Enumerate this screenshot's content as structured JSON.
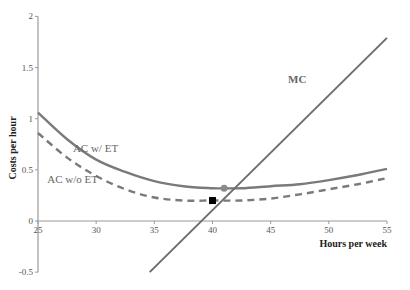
{
  "chart_data": {
    "type": "line",
    "title": "",
    "xlabel": "Hours per week",
    "ylabel": "Costs per hour",
    "xlim": [
      25,
      55
    ],
    "ylim": [
      -0.5,
      2
    ],
    "xticks": [
      25,
      30,
      35,
      40,
      45,
      50,
      55
    ],
    "xtick_labels": [
      "25",
      "30",
      "35",
      "40",
      "45",
      "50",
      "55"
    ],
    "yticks": [
      -0.5,
      0,
      0.5,
      1,
      1.5,
      2
    ],
    "ytick_labels": [
      "-0.5",
      "0",
      "0.5",
      "1",
      "1.5",
      "2"
    ],
    "grid": false,
    "legend": "inline labels",
    "series": [
      {
        "name": "AC w/ ET",
        "style": "solid",
        "color": "#7a7a7a",
        "x": [
          25,
          27.5,
          30,
          32.5,
          35,
          37.5,
          40,
          41,
          42.5,
          45,
          47.5,
          50,
          52.5,
          55
        ],
        "values": [
          1.06,
          0.8,
          0.6,
          0.48,
          0.39,
          0.34,
          0.32,
          0.32,
          0.32,
          0.34,
          0.36,
          0.4,
          0.45,
          0.51
        ]
      },
      {
        "name": "AC w/o ET",
        "style": "dashed",
        "color": "#7a7a7a",
        "x": [
          25,
          27.5,
          30,
          32.5,
          35,
          37.5,
          40,
          42.5,
          45,
          47.5,
          50,
          52.5,
          55
        ],
        "values": [
          0.86,
          0.62,
          0.44,
          0.31,
          0.23,
          0.2,
          0.2,
          0.2,
          0.22,
          0.26,
          0.31,
          0.36,
          0.42
        ]
      },
      {
        "name": "MC",
        "style": "solid",
        "color": "#6e6e6e",
        "x": [
          34.6,
          55
        ],
        "values": [
          -0.5,
          1.79
        ]
      }
    ],
    "markers": [
      {
        "name": "optimum-without-ET",
        "shape": "square",
        "color": "#000000",
        "x": 40,
        "y": 0.2
      },
      {
        "name": "optimum-with-ET",
        "shape": "circle",
        "color": "#8a8a8a",
        "x": 41,
        "y": 0.32
      }
    ],
    "annotations": [
      {
        "text": "AC w/ ET",
        "x": 28,
        "y": 0.67
      },
      {
        "text": "AC w/o ET",
        "x": 25.8,
        "y": 0.37
      },
      {
        "text": "MC",
        "x": 46.5,
        "y": 1.35
      }
    ]
  }
}
